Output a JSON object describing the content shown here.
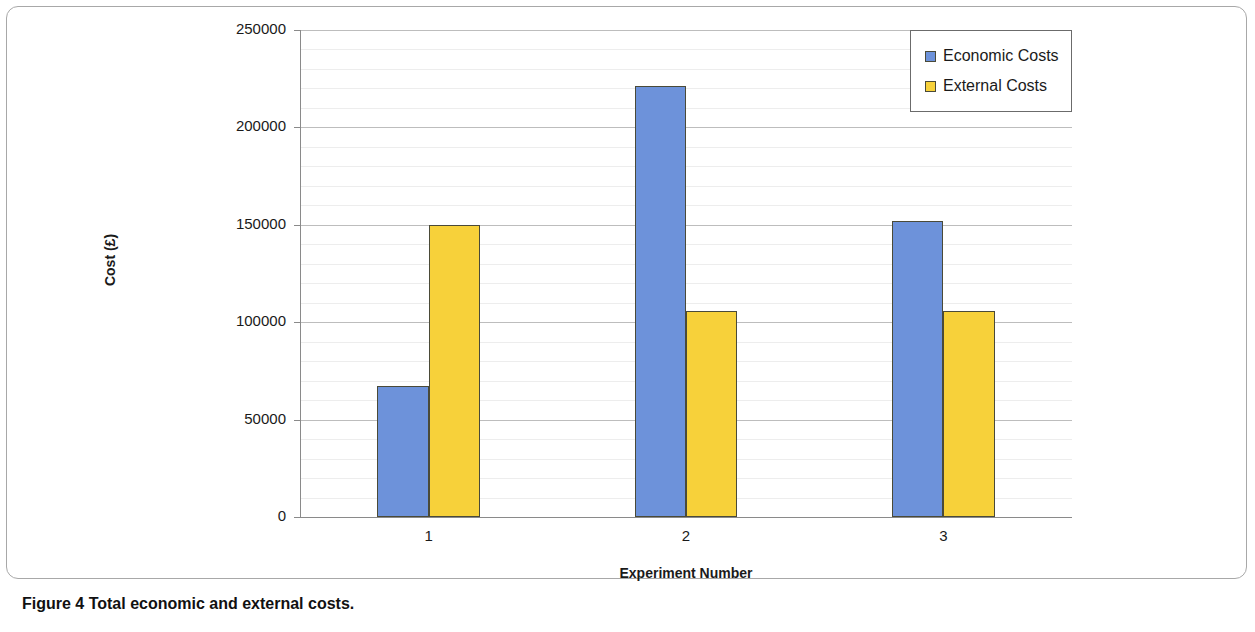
{
  "caption": {
    "prefix": "Figure 4",
    "text": " Total economic and external costs."
  },
  "legend": {
    "position": "top-right",
    "items": [
      {
        "label": "Economic Costs",
        "color": "#6d92da",
        "icon": "square-swatch-icon"
      },
      {
        "label": "External Costs",
        "color": "#f7d13a",
        "icon": "square-swatch-icon"
      }
    ]
  },
  "axes": {
    "y_title": "Cost (£)",
    "x_title": "Experiment Number",
    "y_ticks": [
      "0",
      "50000",
      "100000",
      "150000",
      "200000",
      "250000"
    ],
    "x_ticks": [
      "1",
      "2",
      "3"
    ]
  },
  "chart_data": {
    "type": "bar",
    "title": "",
    "subtitle": "",
    "xlabel": "Experiment Number",
    "ylabel": "Cost (£)",
    "categories": [
      "1",
      "2",
      "3"
    ],
    "series": [
      {
        "name": "Economic Costs",
        "color": "#6d92da",
        "values": [
          67000,
          221000,
          152000
        ]
      },
      {
        "name": "External Costs",
        "color": "#f7d13a",
        "values": [
          150000,
          106000,
          106000
        ]
      }
    ],
    "ylim": [
      0,
      250000
    ],
    "y_major_tick_interval": 50000,
    "y_minor_tick_interval": 10000,
    "y_tick_labels": [
      "0",
      "50000",
      "100000",
      "150000",
      "200000",
      "250000"
    ],
    "grid": true,
    "grid_axis": "y",
    "legend_position": "top-right",
    "bar_group_count": 3,
    "bars_per_group": 2
  }
}
